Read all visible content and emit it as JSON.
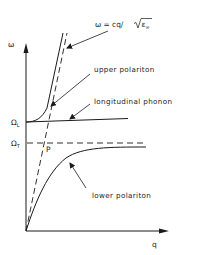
{
  "diagram": {
    "type": "phonon-polariton dispersion",
    "axes": {
      "y_label": "ω",
      "x_label": "q"
    },
    "levels": {
      "omega_L": {
        "symbol": "Ω",
        "subscript": "L"
      },
      "omega_T": {
        "symbol": "Ω",
        "subscript": "T"
      }
    },
    "annotations": {
      "photon_line": {
        "prefix": "ω = cq/",
        "radicand": "ε",
        "radicand_subscript": "∞"
      },
      "upper_polariton": "upper polariton",
      "longitudinal_phonon": "longitudinal phonon",
      "lower_polariton": "lower polariton",
      "crossing_point": "P"
    },
    "colors": {
      "ink": "#1a1a1a",
      "background": "#ffffff"
    }
  }
}
